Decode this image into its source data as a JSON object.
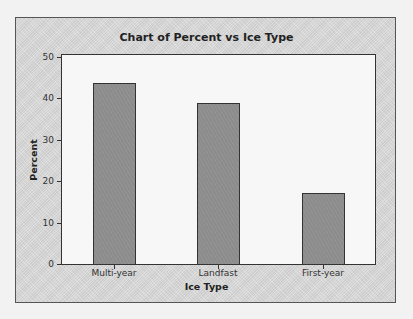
{
  "chart_data": {
    "type": "bar",
    "title": "Chart of Percent vs Ice Type",
    "xlabel": "Ice Type",
    "ylabel": "Percent",
    "categories": [
      "Multi-year",
      "Landfast",
      "First-year"
    ],
    "values": [
      43.6,
      39.0,
      17.1
    ],
    "ylim": [
      0,
      50
    ],
    "yticks": [
      0,
      10,
      20,
      30,
      40,
      50
    ],
    "grid": false,
    "legend": null,
    "colors": {
      "bar_fill": "#8c8c8c",
      "bar_edge": "#333333",
      "plot_background": "#f7f7f7",
      "frame_background": "#d9d9d9"
    }
  }
}
